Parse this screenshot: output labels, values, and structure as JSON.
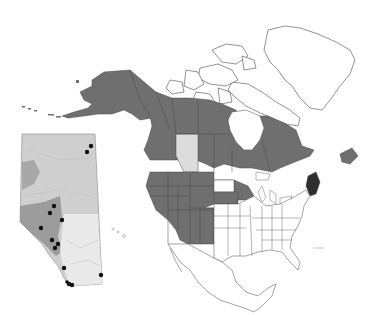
{
  "map": {
    "title": "",
    "colors": {
      "range": "#6f6f6f",
      "range_dark": "#2e2e2e",
      "absent": "#ffffff",
      "light_province": "#dcdcdc",
      "outline": "#4a4a4a",
      "inset_base": "#cfcfcf",
      "inset_mid": "#b5b5b5",
      "inset_dark": "#9a9a9a",
      "inset_light": "#e8e8e8",
      "point": "#111111"
    },
    "regions_shaded": [
      "Alaska",
      "Yukon",
      "Northwest Territories",
      "British Columbia",
      "Saskatchewan",
      "Manitoba",
      "Ontario",
      "Quebec",
      "Newfoundland and Labrador",
      "Nunavut (mainland)",
      "Washington",
      "Oregon",
      "California",
      "Idaho",
      "Nevada",
      "Montana",
      "Wyoming",
      "Utah",
      "Colorado",
      "Arizona",
      "New Mexico",
      "North Dakota",
      "South Dakota",
      "Minnesota",
      "Wisconsin",
      "Michigan"
    ],
    "regions_highlight_light": [
      "Alberta"
    ],
    "regions_highlight_dark": [
      "Maine"
    ],
    "inset": {
      "label": "Alberta inset",
      "points_count": 14
    },
    "scale_label": "▭▭▭"
  }
}
